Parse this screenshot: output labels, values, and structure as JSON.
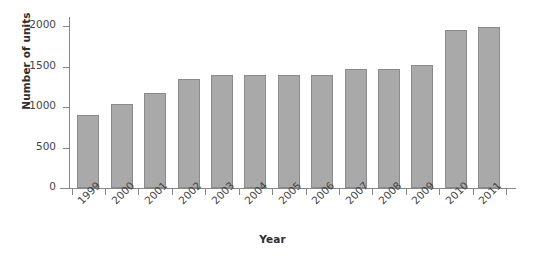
{
  "chart_data": {
    "type": "bar",
    "title": "",
    "xlabel": "Year",
    "ylabel": "Number of units",
    "categories": [
      "1999",
      "2000",
      "2001",
      "2002",
      "2003",
      "2004",
      "2005",
      "2006",
      "2007",
      "2008",
      "2009",
      "2010",
      "2011"
    ],
    "values": [
      900,
      1040,
      1175,
      1350,
      1400,
      1400,
      1400,
      1395,
      1475,
      1470,
      1515,
      1950,
      1990
    ],
    "ylim": [
      0,
      2100
    ],
    "yticks": [
      0,
      500,
      1000,
      1500,
      2000
    ],
    "ytick_labels": [
      "0",
      "500",
      "1000",
      "1500",
      "2000"
    ],
    "grid": false,
    "legend": null,
    "bar_color": "#a9a9a9",
    "bar_border_color": "#8a8a8a",
    "axis_color": "#878787",
    "text_color": "#444444"
  }
}
